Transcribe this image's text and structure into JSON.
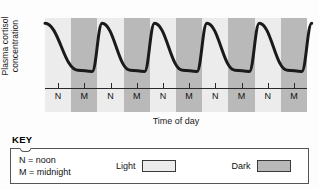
{
  "chart_data": {
    "type": "line",
    "title": "",
    "ylabel": "Plasma cortisol\nconcentration",
    "xlabel": "Time of day",
    "grid": false,
    "legend_position": "below-chart",
    "axis_ticks_x": [
      "N",
      "M",
      "N",
      "M",
      "N",
      "M",
      "N",
      "M",
      "N",
      "M"
    ],
    "y_axis_ticks": [],
    "x": [
      0,
      0.5,
      1,
      1.5,
      2,
      2.5,
      3,
      3.5,
      4,
      4.5,
      5
    ],
    "series": [
      {
        "name": "Plasma cortisol concentration",
        "description": "Circadian rhythm: cortisol peaks shortly after midnight (early morning) and falls to a trough around midnight.",
        "values": [
          95,
          22,
          95,
          22,
          95,
          22,
          95,
          22,
          95,
          22,
          95
        ]
      }
    ],
    "bands": [
      {
        "label": "Light",
        "tick": "N",
        "shade": "light"
      },
      {
        "label": "Dark",
        "tick": "M",
        "shade": "dark"
      },
      {
        "label": "Light",
        "tick": "N",
        "shade": "light"
      },
      {
        "label": "Dark",
        "tick": "M",
        "shade": "dark"
      },
      {
        "label": "Light",
        "tick": "N",
        "shade": "light"
      },
      {
        "label": "Dark",
        "tick": "M",
        "shade": "dark"
      },
      {
        "label": "Light",
        "tick": "N",
        "shade": "light"
      },
      {
        "label": "Dark",
        "tick": "M",
        "shade": "dark"
      },
      {
        "label": "Light",
        "tick": "N",
        "shade": "light"
      },
      {
        "label": "Dark",
        "tick": "M",
        "shade": "dark"
      }
    ],
    "colors": {
      "light_band": "#ececec",
      "dark_band": "#b9b9b9",
      "curve": "#1a1a1a",
      "axis": "#2a2a2a",
      "background": "#fdfdfd"
    }
  },
  "chart": {
    "y_axis_label": "Plasma cortisol\nconcentration",
    "x_axis_label": "Time of day"
  },
  "key": {
    "title": "KEY",
    "definitions": [
      "N = noon",
      "M = midnight"
    ],
    "swatches": [
      {
        "label": "Light",
        "color": "#ececec"
      },
      {
        "label": "Dark",
        "color": "#b9b9b9"
      }
    ]
  }
}
